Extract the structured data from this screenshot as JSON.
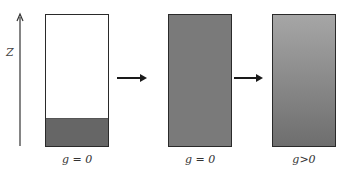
{
  "axis": {
    "label": "Z"
  },
  "panels": [
    {
      "label": "g = 0",
      "fill": "partial-bottom",
      "fill_color": "#666666"
    },
    {
      "label": "g = 0",
      "fill": "uniform",
      "fill_color": "#7a7a7a"
    },
    {
      "label": "g>0",
      "fill": "gradient",
      "gradient_top": "#a6a6a6",
      "gradient_bottom": "#6e6e6e"
    }
  ],
  "colors": {
    "stroke": "#2a2a2a",
    "arrow": "#1a1a1a"
  }
}
